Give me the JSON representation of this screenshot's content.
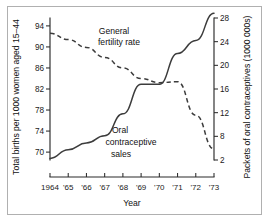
{
  "chart_data": {
    "type": "line",
    "title": "",
    "xlabel": "Year",
    "x": [
      1964,
      1965,
      1966,
      1967,
      1968,
      1969,
      1970,
      1971,
      1972,
      1973
    ],
    "xtick_labels": [
      "1964",
      "'65",
      "'66",
      "'67",
      "'68",
      "'69",
      "'70",
      "'71",
      "'72",
      "'73"
    ],
    "grid": false,
    "legend_position": "inline-annotations",
    "left_axis": {
      "label": "Total births per 1000 women aged 15–44",
      "ticks": [
        70,
        74,
        78,
        82,
        86,
        90,
        94
      ],
      "tick_labels": [
        "70",
        "74",
        "78",
        "82",
        "86",
        "90",
        "94"
      ],
      "ylim": [
        68.5,
        95.5
      ]
    },
    "right_axis": {
      "label": "Packets of oral contraceptives (1000 000s)",
      "ticks": [
        2,
        8,
        12,
        16,
        20,
        24,
        28
      ],
      "tick_labels": [
        "2",
        "8",
        "12",
        "16",
        "20",
        "24",
        "28"
      ],
      "ylim": [
        0.5,
        29.5
      ]
    },
    "series": [
      {
        "name": "General fertility rate",
        "axis": "left",
        "style": "dashed",
        "annotation": [
          "General",
          "fertility rate"
        ],
        "values": [
          92.6,
          91.4,
          89.9,
          88.0,
          86.0,
          84.0,
          83.2,
          83.4,
          77.0,
          70.6
        ]
      },
      {
        "name": "Oral contraceptive sales",
        "axis": "right",
        "style": "solid",
        "annotation": [
          "Oral",
          "contraceptive",
          "sales"
        ],
        "values": [
          2.4,
          4.6,
          6.3,
          8.1,
          11.8,
          16.8,
          16.8,
          22.0,
          24.2,
          28.8
        ]
      }
    ]
  },
  "annotations": {
    "fertility": {
      "line1": "General",
      "line2": "fertility rate"
    },
    "sales": {
      "line1": "Oral",
      "line2": "contraceptive",
      "line3": "sales"
    }
  }
}
